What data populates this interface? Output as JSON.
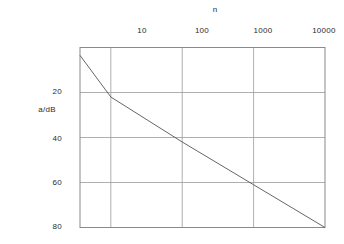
{
  "chart_data": {
    "type": "line",
    "title": "",
    "xlabel": "n",
    "ylabel": "a/dB",
    "xscale": "log",
    "xlim": [
      3.7,
      10000
    ],
    "ylim": [
      80,
      0
    ],
    "y_inverted": true,
    "grid": true,
    "legend": false,
    "xticks": [
      {
        "value": 10,
        "label": "10"
      },
      {
        "value": 100,
        "label": "100"
      },
      {
        "value": 1000,
        "label": "1000"
      },
      {
        "value": 10000,
        "label": "10000"
      }
    ],
    "yticks": [
      {
        "value": 20,
        "label": "20"
      },
      {
        "value": 40,
        "label": "40"
      },
      {
        "value": 60,
        "label": "60"
      },
      {
        "value": 80,
        "label": "80"
      }
    ],
    "series": [
      {
        "name": "attenuation",
        "points": [
          {
            "x": 3.7,
            "y": 3.5
          },
          {
            "x": 10,
            "y": 22
          },
          {
            "x": 100,
            "y": 42
          },
          {
            "x": 1000,
            "y": 61
          },
          {
            "x": 10000,
            "y": 80
          }
        ]
      }
    ],
    "slope_db_per_decade": 20,
    "line_color": "#555555",
    "grid_color": "#9a9a9a",
    "axis_color": "#8a8a8a",
    "background_color": "#ffffff"
  },
  "axes": {
    "x_title": "n",
    "y_title": "a/dB"
  }
}
